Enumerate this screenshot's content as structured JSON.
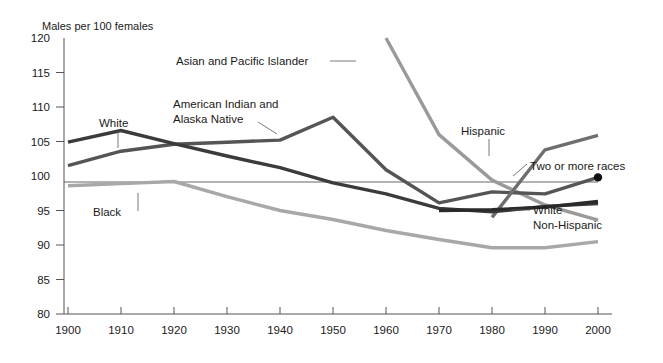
{
  "chart_data": {
    "type": "line",
    "title": "",
    "subtitle": "",
    "unit_title": "Males per 100 females",
    "xlabel": "",
    "ylabel": "",
    "xlim": [
      1895,
      2005
    ],
    "ylim": [
      80,
      120
    ],
    "yticks": [
      80,
      85,
      90,
      95,
      100,
      105,
      110,
      115,
      120
    ],
    "ytick_labels": [
      "80",
      "85",
      "90",
      "95",
      "100",
      "105",
      "110",
      "115",
      "120"
    ],
    "xticks": [
      1900,
      1910,
      1920,
      1930,
      1940,
      1950,
      1960,
      1970,
      1980,
      1990,
      2000
    ],
    "xtick_labels": [
      "1900",
      "1910",
      "1920",
      "1930",
      "1940",
      "1950",
      "1960",
      "1970",
      "1980",
      "1990",
      "2000"
    ],
    "grid": "horizontal reference line at 100 only",
    "legend": "inline labels with leader lines",
    "categories": [
      1900,
      1910,
      1920,
      1930,
      1940,
      1950,
      1960,
      1970,
      1980,
      1990,
      2000
    ],
    "series": [
      {
        "name": "White",
        "label": "White",
        "color": "#3b3b3b",
        "x": [
          1900,
          1910,
          1920,
          1930,
          1940,
          1950,
          1960,
          1970,
          1980,
          1990,
          2000
        ],
        "values": [
          104.9,
          106.6,
          104.7,
          102.9,
          101.2,
          99.0,
          97.4,
          95.3,
          94.8,
          95.6,
          96.0
        ]
      },
      {
        "name": "Black",
        "label": "Black",
        "color": "#a8a8a8",
        "x": [
          1900,
          1910,
          1920,
          1930,
          1940,
          1950,
          1960,
          1970,
          1980,
          1990,
          2000
        ],
        "values": [
          98.6,
          98.9,
          99.2,
          97.0,
          95.0,
          93.7,
          92.1,
          90.8,
          89.6,
          89.6,
          90.5
        ]
      },
      {
        "name": "American Indian and Alaska Native",
        "label": "American Indian and\nAlaska Native",
        "color": "#555555",
        "x": [
          1900,
          1910,
          1920,
          1930,
          1940,
          1950,
          1960,
          1970,
          1980,
          1990,
          2000
        ],
        "values": [
          101.5,
          103.6,
          104.6,
          104.9,
          105.2,
          108.5,
          100.9,
          96.1,
          97.7,
          97.4,
          99.8
        ]
      },
      {
        "name": "Asian and Pacific Islander",
        "label": "Asian and Pacific Islander",
        "color": "#9a9a9a",
        "x": [
          1960,
          1970,
          1980,
          1990,
          2000
        ],
        "values": [
          120.0,
          106.0,
          99.4,
          95.8,
          93.6
        ]
      },
      {
        "name": "Hispanic",
        "label": "Hispanic",
        "color": "#6e6e6e",
        "x": [
          1980,
          1990,
          2000
        ],
        "values": [
          94.0,
          103.8,
          105.9
        ]
      },
      {
        "name": "White Non-Hispanic",
        "label": "White\nNon-Hispanic",
        "color": "#2a2a2a",
        "x": [
          1970,
          1980,
          1990,
          2000
        ],
        "values": [
          95.0,
          95.1,
          95.5,
          96.3
        ]
      }
    ],
    "annotations": [
      {
        "name": "two-or-more-races-point",
        "label": "Two or more races",
        "x": 2000,
        "y": 99.8,
        "marker": "filled-circle",
        "color": "#111111"
      }
    ]
  },
  "labels": {
    "unit_title": "Males per 100 females",
    "white": "White",
    "black": "Black",
    "american_indian_line1": "American Indian and",
    "american_indian_line2": "Alaska Native",
    "asian_pacific": "Asian and Pacific Islander",
    "hispanic": "Hispanic",
    "two_or_more_races": "Two or more races",
    "white_nonhispanic_line1": "White",
    "white_nonhispanic_line2": "Non-Hispanic"
  },
  "axis": {
    "y_ticks": [
      "120",
      "115",
      "110",
      "105",
      "100",
      "95",
      "90",
      "85",
      "80"
    ],
    "x_ticks": [
      "1900",
      "1910",
      "1920",
      "1930",
      "1940",
      "1950",
      "1960",
      "1970",
      "1980",
      "1990",
      "2000"
    ]
  },
  "colors": {
    "white_series": "#3b3b3b",
    "black_series": "#a8a8a8",
    "aian_series": "#555555",
    "api_series": "#9a9a9a",
    "hispanic_series": "#6e6e6e",
    "white_nh_series": "#2a2a2a",
    "axis": "#555555",
    "text": "#1a1a1a",
    "background": "#ffffff"
  }
}
